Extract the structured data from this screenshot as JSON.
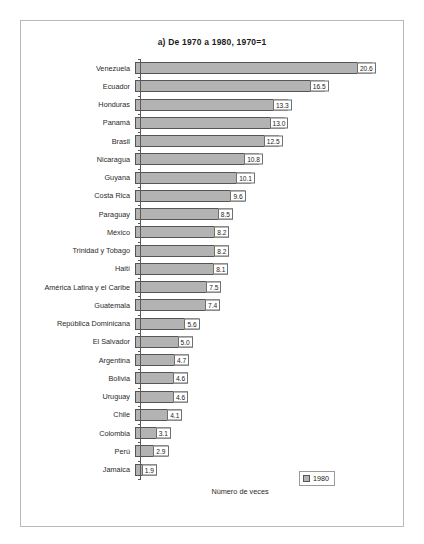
{
  "chart_data": {
    "type": "bar",
    "orientation": "horizontal",
    "title": "a) De 1970 a 1980, 1970=1",
    "xlabel": "Número de veces",
    "ylabel": "",
    "grid": false,
    "xlim": [
      0,
      22
    ],
    "legend": {
      "position": "bottom-right",
      "entries": [
        {
          "label": "1980",
          "color": "#b3b3b3"
        }
      ]
    },
    "categories": [
      "Venezuela",
      "Ecuador",
      "Honduras",
      "Panamá",
      "Brasil",
      "Nicaragua",
      "Guyana",
      "Costa Rica",
      "Paraguay",
      "México",
      "Trinidad y Tobago",
      "Haití",
      "América Latina y el Caribe",
      "Guatemala",
      "República Dominicana",
      "El Salvador",
      "Argentina",
      "Bolivia",
      "Uruguay",
      "Chile",
      "Colombia",
      "Perú",
      "Jamaica"
    ],
    "values": [
      20.6,
      16.5,
      13.3,
      13.0,
      12.5,
      10.8,
      10.1,
      9.6,
      8.5,
      8.2,
      8.2,
      8.1,
      7.5,
      7.4,
      5.6,
      5.0,
      4.7,
      4.6,
      4.6,
      4.1,
      3.1,
      2.9,
      1.9
    ],
    "value_labels": [
      "20.6",
      "16.5",
      "13.3",
      "13.0",
      "12.5",
      "10.8",
      "10.1",
      "9.6",
      "8.5",
      "8.2",
      "8.2",
      "8.1",
      "7.5",
      "7.4",
      "5.6",
      "5.0",
      "4.7",
      "4.6",
      "4.6",
      "4.1",
      "3.1",
      "2.9",
      "1.9"
    ],
    "series": [
      {
        "name": "1980",
        "values": [
          20.6,
          16.5,
          13.3,
          13.0,
          12.5,
          10.8,
          10.1,
          9.6,
          8.5,
          8.2,
          8.2,
          8.1,
          7.5,
          7.4,
          5.6,
          5.0,
          4.7,
          4.6,
          4.6,
          4.1,
          3.1,
          2.9,
          1.9
        ]
      }
    ]
  },
  "colors": {
    "bar_fill": "#b3b3b3",
    "bar_border": "#555555",
    "axis": "#5a5a5a",
    "frame": "#b9b9b9",
    "text": "#1b1b1b"
  }
}
